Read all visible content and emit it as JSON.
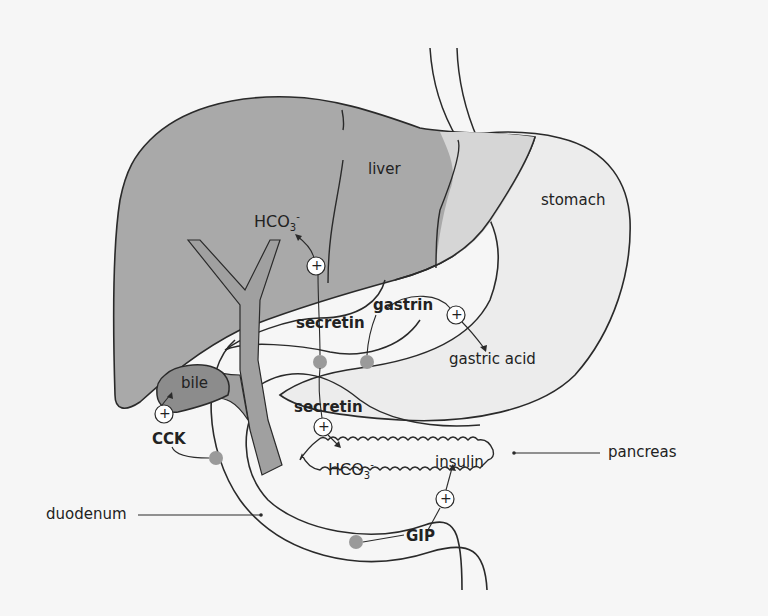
{
  "diagram": {
    "colors": {
      "background": "#f6f6f6",
      "liver": "#a9a9a9",
      "gallbladder_bile": "#8c8c8c",
      "duct": "#a0a0a0",
      "organ_outline": "#2a2a2a",
      "stomach_fill": "#ebebeb",
      "endocrine_cell_dot": "#9a9a9a",
      "plus_circle_fill": "#ffffff"
    },
    "organs": {
      "liver": "liver",
      "stomach": "stomach",
      "bile": "bile",
      "pancreas": "pancreas",
      "duodenum": "duodenum"
    },
    "hormones": {
      "gastrin": "gastrin",
      "secretin_upper": "secretin",
      "secretin_lower": "secretin",
      "cck": "CCK",
      "gip": "GIP"
    },
    "products": {
      "hco3_liver_base": "HCO",
      "hco3_liver_sub": "3",
      "hco3_liver_sup": "-",
      "hco3_pancreas_base": "HCO",
      "hco3_pancreas_sub": "3",
      "hco3_pancreas_sup": "-",
      "gastric_acid": "gastric acid",
      "insulin": "insulin"
    },
    "stimulation_symbol": "+",
    "relationships": [
      {
        "hormone": "gastrin",
        "effect": "+",
        "target": "gastric acid"
      },
      {
        "hormone": "secretin",
        "effect": "+",
        "target": "HCO3- (liver)"
      },
      {
        "hormone": "secretin",
        "effect": "+",
        "target": "HCO3- (pancreas)"
      },
      {
        "hormone": "CCK",
        "effect": "+",
        "target": "bile (gallbladder)"
      },
      {
        "hormone": "GIP",
        "effect": "+",
        "target": "insulin"
      }
    ]
  }
}
